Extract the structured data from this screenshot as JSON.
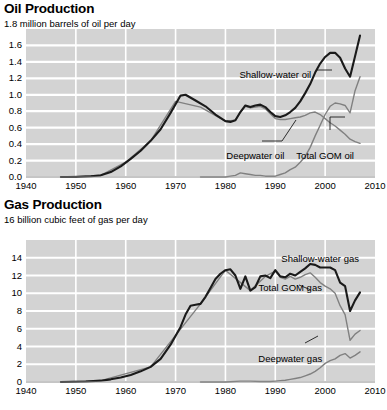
{
  "chart_data": [
    {
      "type": "line",
      "title": "Oil Production",
      "subtitle": "1.8 million barrels of oil per day",
      "xlabel": "",
      "ylabel": "million barrels of oil per day",
      "xlim": [
        1940,
        2010
      ],
      "ylim": [
        0.0,
        1.8
      ],
      "grid": true,
      "legend_position": "inline-annotations",
      "xticks": [
        "1940",
        "1950",
        "1960",
        "1970",
        "1980",
        "1990",
        "2000",
        "2010"
      ],
      "yticks": [
        "0.0",
        "0.2",
        "0.4",
        "0.6",
        "0.8",
        "1.0",
        "1.2",
        "1.4",
        "1.6",
        "1.8"
      ],
      "annotations": [
        {
          "text": "Shallow-water oil",
          "x": 1990,
          "y": 1.24
        },
        {
          "text": "Deepwater oil",
          "x": 1986,
          "y": 0.26
        },
        {
          "text": "Total GOM oil",
          "x": 2000,
          "y": 0.25
        }
      ],
      "series": [
        {
          "name": "Total GOM oil",
          "color": "#1a1a1a",
          "width": 2.1,
          "x": [
            1947,
            1950,
            1953,
            1955,
            1957,
            1959,
            1961,
            1963,
            1965,
            1967,
            1969,
            1971,
            1972,
            1974,
            1976,
            1978,
            1980,
            1981,
            1982,
            1983,
            1984,
            1985,
            1986,
            1987,
            1988,
            1989,
            1990,
            1991,
            1992,
            1993,
            1994,
            1995,
            1996,
            1997,
            1998,
            1999,
            2000,
            2001,
            2002,
            2003,
            2004,
            2005,
            2006,
            2007
          ],
          "values": [
            0.0,
            0.0,
            0.01,
            0.02,
            0.06,
            0.13,
            0.22,
            0.32,
            0.44,
            0.58,
            0.78,
            0.99,
            1.0,
            0.93,
            0.86,
            0.76,
            0.68,
            0.67,
            0.69,
            0.79,
            0.87,
            0.85,
            0.87,
            0.88,
            0.85,
            0.79,
            0.74,
            0.73,
            0.75,
            0.79,
            0.84,
            0.92,
            1.02,
            1.13,
            1.27,
            1.38,
            1.46,
            1.51,
            1.51,
            1.45,
            1.32,
            1.22,
            1.47,
            1.72
          ]
        },
        {
          "name": "Shallow-water oil",
          "color": "#808080",
          "width": 1.4,
          "x": [
            1947,
            1955,
            1960,
            1965,
            1970,
            1975,
            1980,
            1982,
            1983,
            1984,
            1985,
            1986,
            1987,
            1988,
            1989,
            1990,
            1991,
            1992,
            1993,
            1994,
            1995,
            1996,
            1997,
            1998,
            1999,
            2000,
            2001,
            2002,
            2003,
            2004,
            2005,
            2006,
            2007
          ],
          "values": [
            0.0,
            0.02,
            0.18,
            0.44,
            0.92,
            0.85,
            0.68,
            0.69,
            0.79,
            0.86,
            0.84,
            0.85,
            0.86,
            0.83,
            0.77,
            0.71,
            0.7,
            0.7,
            0.71,
            0.72,
            0.73,
            0.75,
            0.78,
            0.79,
            0.76,
            0.71,
            0.66,
            0.62,
            0.57,
            0.52,
            0.46,
            0.43,
            0.41
          ]
        },
        {
          "name": "Deepwater oil",
          "color": "#808080",
          "width": 1.4,
          "x": [
            1975,
            1978,
            1980,
            1981,
            1982,
            1983,
            1984,
            1985,
            1986,
            1987,
            1988,
            1989,
            1990,
            1991,
            1992,
            1993,
            1994,
            1995,
            1996,
            1997,
            1998,
            1999,
            2000,
            2001,
            2002,
            2003,
            2004,
            2005,
            2006,
            2007
          ],
          "values": [
            0.0,
            0.0,
            0.0,
            0.01,
            0.02,
            0.05,
            0.04,
            0.03,
            0.02,
            0.02,
            0.01,
            0.01,
            0.01,
            0.03,
            0.05,
            0.09,
            0.12,
            0.18,
            0.25,
            0.36,
            0.5,
            0.63,
            0.76,
            0.86,
            0.9,
            0.89,
            0.87,
            0.78,
            1.05,
            1.22
          ]
        }
      ]
    },
    {
      "type": "line",
      "title": "Gas Production",
      "subtitle": "16 billion cubic feet of gas per day",
      "xlabel": "",
      "ylabel": "billion cubic feet of gas per day",
      "xlim": [
        1940,
        2010
      ],
      "ylim": [
        0,
        16
      ],
      "grid": true,
      "legend_position": "inline-annotations",
      "xticks": [
        "1940",
        "1950",
        "1960",
        "1970",
        "1980",
        "1990",
        "2000",
        "2010"
      ],
      "yticks": [
        "0",
        "2",
        "4",
        "6",
        "8",
        "10",
        "12",
        "14",
        "16"
      ],
      "annotations": [
        {
          "text": "Shallow-water gas",
          "x": 1999,
          "y": 13.9
        },
        {
          "text": "Total GOM gas",
          "x": 1993,
          "y": 10.6
        },
        {
          "text": "Deepwater gas",
          "x": 1993,
          "y": 2.6
        }
      ],
      "series": [
        {
          "name": "Total GOM gas",
          "color": "#1a1a1a",
          "width": 2.1,
          "x": [
            1947,
            1952,
            1955,
            1957,
            1959,
            1961,
            1963,
            1965,
            1967,
            1969,
            1971,
            1972,
            1973,
            1974,
            1975,
            1976,
            1977,
            1978,
            1979,
            1980,
            1981,
            1982,
            1983,
            1984,
            1985,
            1986,
            1987,
            1988,
            1989,
            1990,
            1991,
            1992,
            1993,
            1994,
            1995,
            1996,
            1997,
            1998,
            1999,
            2000,
            2001,
            2002,
            2003,
            2004,
            2005,
            2006,
            2007
          ],
          "values": [
            0.0,
            0.05,
            0.15,
            0.3,
            0.5,
            0.8,
            1.2,
            1.7,
            2.6,
            4.2,
            6.2,
            7.6,
            8.6,
            8.7,
            8.8,
            9.6,
            10.6,
            11.6,
            12.2,
            12.6,
            12.7,
            12.0,
            10.5,
            11.9,
            10.3,
            10.7,
            11.9,
            12.0,
            11.7,
            12.6,
            11.9,
            11.8,
            12.2,
            12.0,
            12.4,
            12.8,
            13.3,
            13.2,
            12.9,
            12.9,
            12.9,
            12.6,
            11.2,
            10.8,
            8.0,
            9.2,
            10.1
          ]
        },
        {
          "name": "Shallow-water gas",
          "color": "#808080",
          "width": 1.4,
          "x": [
            1947,
            1955,
            1965,
            1975,
            1980,
            1985,
            1988,
            1990,
            1991,
            1992,
            1993,
            1994,
            1995,
            1996,
            1997,
            1998,
            1999,
            2000,
            2001,
            2002,
            2003,
            2004,
            2005,
            2006,
            2007
          ],
          "values": [
            0.0,
            0.15,
            1.7,
            8.8,
            12.6,
            10.3,
            11.9,
            12.5,
            11.8,
            11.6,
            11.9,
            11.6,
            11.8,
            12.1,
            12.3,
            11.8,
            11.2,
            10.8,
            10.5,
            10.0,
            8.6,
            7.6,
            4.7,
            5.4,
            5.8
          ]
        },
        {
          "name": "Deepwater gas",
          "color": "#808080",
          "width": 1.4,
          "x": [
            1975,
            1980,
            1983,
            1985,
            1987,
            1989,
            1990,
            1991,
            1992,
            1993,
            1994,
            1995,
            1996,
            1997,
            1998,
            1999,
            2000,
            2001,
            2002,
            2003,
            2004,
            2005,
            2006,
            2007
          ],
          "values": [
            0.0,
            0.0,
            0.1,
            0.1,
            0.05,
            0.05,
            0.1,
            0.15,
            0.2,
            0.3,
            0.4,
            0.5,
            0.7,
            0.9,
            1.2,
            1.6,
            2.1,
            2.4,
            2.6,
            3.0,
            3.2,
            2.7,
            3.0,
            3.4
          ]
        }
      ]
    }
  ]
}
